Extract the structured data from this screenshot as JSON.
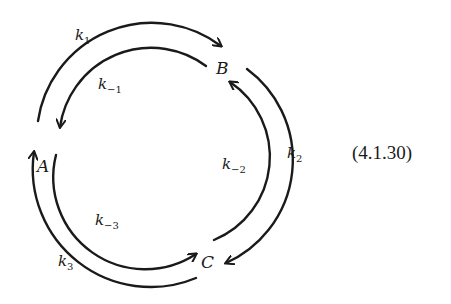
{
  "diagram": {
    "type": "reaction-cycle",
    "nodes": [
      {
        "id": "A",
        "label": "A"
      },
      {
        "id": "B",
        "label": "B"
      },
      {
        "id": "C",
        "label": "C"
      }
    ],
    "edges": [
      {
        "from": "A",
        "to": "B",
        "rate": "k",
        "sub": "1",
        "position": "outer"
      },
      {
        "from": "B",
        "to": "A",
        "rate": "k",
        "sub": "−1",
        "position": "inner"
      },
      {
        "from": "B",
        "to": "C",
        "rate": "k",
        "sub": "2",
        "position": "outer"
      },
      {
        "from": "C",
        "to": "B",
        "rate": "k",
        "sub": "−2",
        "position": "inner"
      },
      {
        "from": "C",
        "to": "A",
        "rate": "k",
        "sub": "3",
        "position": "outer"
      },
      {
        "from": "A",
        "to": "C",
        "rate": "k",
        "sub": "−3",
        "position": "inner"
      }
    ],
    "equation_number": "(4.1.30)",
    "colors": {
      "ink": "#1a1a1a",
      "background": "#ffffff"
    }
  }
}
